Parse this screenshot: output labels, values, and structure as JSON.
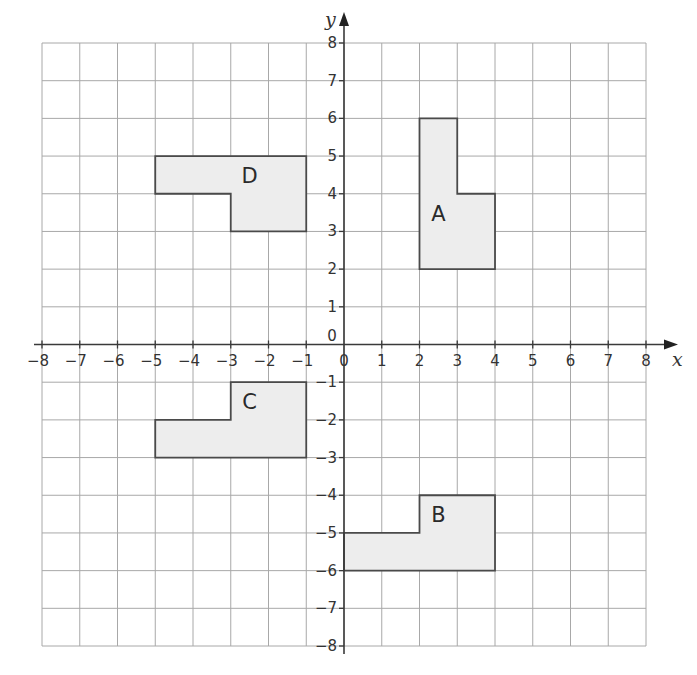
{
  "chart_data": {
    "type": "coordinate-grid",
    "xlabel": "x",
    "ylabel": "y",
    "xlim": [
      -8,
      8
    ],
    "ylim": [
      -8,
      8
    ],
    "grid": true,
    "x_ticks": [
      "-8",
      "-7",
      "-6",
      "-5",
      "-4",
      "-3",
      "-2",
      "-1",
      "1",
      "2",
      "3",
      "4",
      "5",
      "6",
      "7",
      "8"
    ],
    "y_ticks": [
      "8",
      "7",
      "6",
      "5",
      "4",
      "3",
      "2",
      "1",
      "-1",
      "-2",
      "-3",
      "-4",
      "-5",
      "-6",
      "-7",
      "-8"
    ],
    "origin_label": "0",
    "shapes": [
      {
        "label": "A",
        "vertices": [
          [
            2,
            2
          ],
          [
            2,
            6
          ],
          [
            3,
            6
          ],
          [
            3,
            4
          ],
          [
            4,
            4
          ],
          [
            4,
            2
          ]
        ],
        "label_pos": [
          2.5,
          3.5
        ]
      },
      {
        "label": "B",
        "vertices": [
          [
            0,
            -6
          ],
          [
            0,
            -5
          ],
          [
            2,
            -5
          ],
          [
            2,
            -4
          ],
          [
            4,
            -4
          ],
          [
            4,
            -6
          ]
        ],
        "label_pos": [
          2.5,
          -4.5
        ]
      },
      {
        "label": "C",
        "vertices": [
          [
            -5,
            -3
          ],
          [
            -5,
            -2
          ],
          [
            -3,
            -2
          ],
          [
            -3,
            -1
          ],
          [
            -1,
            -1
          ],
          [
            -1,
            -3
          ]
        ],
        "label_pos": [
          -2.5,
          -1.5
        ]
      },
      {
        "label": "D",
        "vertices": [
          [
            -5,
            4
          ],
          [
            -5,
            5
          ],
          [
            -1,
            5
          ],
          [
            -1,
            3
          ],
          [
            -3,
            3
          ],
          [
            -3,
            4
          ]
        ],
        "label_pos": [
          -2.5,
          4.5
        ]
      }
    ]
  },
  "colors": {
    "grid": "#a8a8a8",
    "axis": "#3a3a3a",
    "shape_fill": "#ededed",
    "shape_stroke": "#4a4a4a"
  }
}
